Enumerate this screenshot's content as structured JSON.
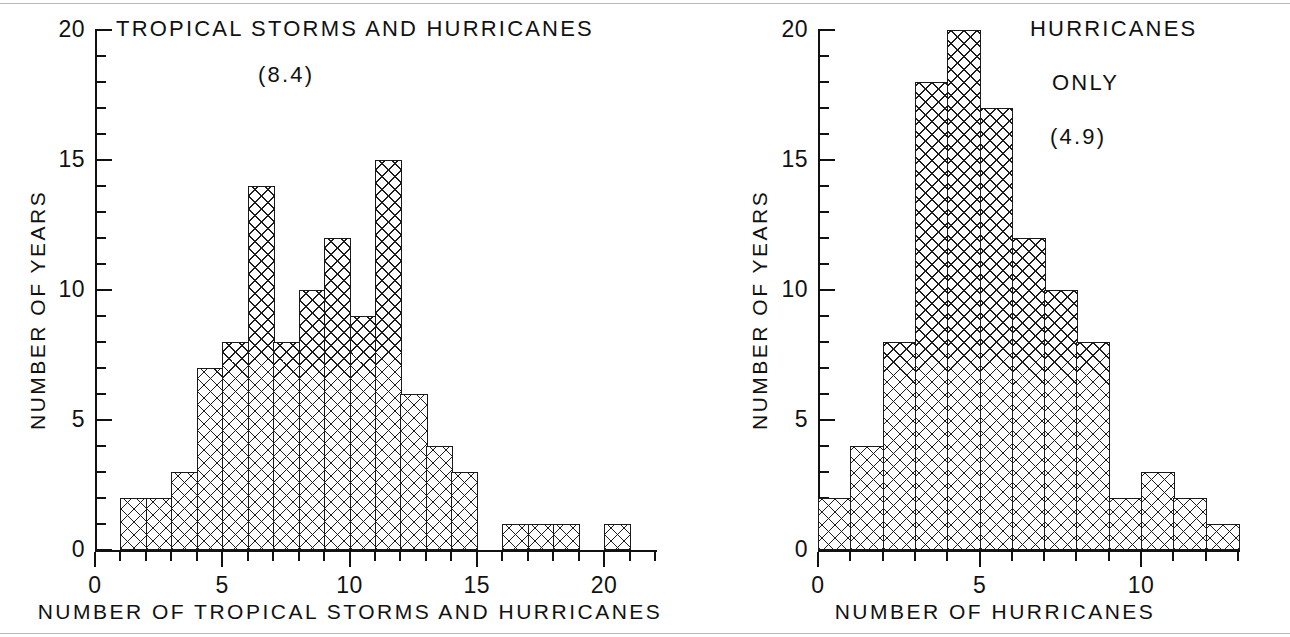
{
  "figure": {
    "panels": [
      {
        "id": "tropical-storms-and-hurricanes",
        "title_line1": "TROPICAL STORMS AND HURRICANES",
        "title_line2": "(8.4)",
        "mean_value": "8.4",
        "ylabel": "NUMBER OF YEARS",
        "xlabel": "NUMBER OF TROPICAL STORMS AND HURRICANES",
        "ytick_labels": [
          "0",
          "5",
          "10",
          "15",
          "20"
        ],
        "xtick_labels": [
          "0",
          "5",
          "10",
          "15",
          "20"
        ]
      },
      {
        "id": "hurricanes-only",
        "title_line1": "HURRICANES",
        "title_line2": "ONLY",
        "title_line3": "(4.9)",
        "mean_value": "4.9",
        "ylabel": "NUMBER OF YEARS",
        "xlabel": "NUMBER OF HURRICANES",
        "ytick_labels": [
          "0",
          "5",
          "10",
          "15",
          "20"
        ],
        "xtick_labels": [
          "0",
          "5",
          "10"
        ]
      }
    ]
  },
  "chart_data": [
    {
      "type": "bar",
      "title": "TROPICAL STORMS AND HURRICANES (8.4)",
      "subtitle": "(8.4)",
      "xlabel": "NUMBER OF TROPICAL STORMS AND HURRICANES",
      "ylabel": "NUMBER OF YEARS",
      "xlim": [
        0,
        22
      ],
      "ylim": [
        0,
        20
      ],
      "xticks": [
        0,
        5,
        10,
        15,
        20
      ],
      "yticks": [
        0,
        5,
        10,
        15,
        20
      ],
      "xminor_step": 1,
      "yminor_step": 1,
      "grid": false,
      "legend": "none",
      "bin_width": 1,
      "bin_starts": [
        0,
        1,
        2,
        3,
        4,
        5,
        6,
        7,
        8,
        9,
        10,
        11,
        12,
        13,
        14,
        15,
        16,
        17,
        18,
        19,
        20,
        21
      ],
      "categories": [
        "0-1",
        "1-2",
        "2-3",
        "3-4",
        "4-5",
        "5-6",
        "6-7",
        "7-8",
        "8-9",
        "9-10",
        "10-11",
        "11-12",
        "12-13",
        "13-14",
        "14-15",
        "15-16",
        "16-17",
        "17-18",
        "18-19",
        "19-20",
        "20-21",
        "21-22"
      ],
      "values": [
        0,
        2,
        2,
        3,
        7,
        8,
        14,
        8,
        10,
        12,
        9,
        15,
        6,
        4,
        3,
        0,
        1,
        1,
        1,
        0,
        1,
        0
      ],
      "annotations": [
        "(8.4)"
      ]
    },
    {
      "type": "bar",
      "title": "HURRICANES ONLY (4.9)",
      "subtitle": "(4.9)",
      "xlabel": "NUMBER OF HURRICANES",
      "ylabel": "NUMBER OF YEARS",
      "xlim": [
        0,
        13
      ],
      "ylim": [
        0,
        20
      ],
      "xticks": [
        0,
        5,
        10
      ],
      "yticks": [
        0,
        5,
        10,
        15,
        20
      ],
      "xminor_step": 1,
      "yminor_step": 1,
      "grid": false,
      "legend": "none",
      "bin_width": 1,
      "bin_starts": [
        0,
        1,
        2,
        3,
        4,
        5,
        6,
        7,
        8,
        9,
        10,
        11,
        12
      ],
      "categories": [
        "0-1",
        "1-2",
        "2-3",
        "3-4",
        "4-5",
        "5-6",
        "6-7",
        "7-8",
        "8-9",
        "9-10",
        "10-11",
        "11-12",
        "12-13"
      ],
      "values": [
        2,
        4,
        8,
        18,
        20,
        17,
        12,
        10,
        8,
        2,
        3,
        2,
        1
      ],
      "annotations": [
        "(4.9)"
      ]
    }
  ]
}
